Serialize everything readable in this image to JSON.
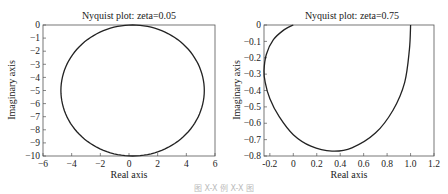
{
  "chart_data": [
    {
      "type": "line",
      "title": "Nyquist plot: zeta=0.05",
      "xlabel": "Real axis",
      "ylabel": "Imaginary axis",
      "xlim": [
        -6,
        6
      ],
      "ylim": [
        -10,
        0
      ],
      "xticks": [
        -6,
        -4,
        -2,
        0,
        2,
        4,
        6
      ],
      "xtick_labels": [
        "−6",
        "−4",
        "−2",
        "0",
        "2",
        "4",
        "6"
      ],
      "yticks": [
        0,
        -1,
        -2,
        -3,
        -4,
        -5,
        -6,
        -7,
        -8,
        -9,
        -10
      ],
      "ytick_labels": [
        "0",
        "−1",
        "−2",
        "−3",
        "−4",
        "−5",
        "−6",
        "−7",
        "−8",
        "−9",
        "−10"
      ],
      "grid": false,
      "series": [
        {
          "name": "G(jw)",
          "shape": "closed loop approx. circle",
          "center": [
            0.25,
            -5.0
          ],
          "x_range": [
            -4.75,
            5.25
          ],
          "y_range": [
            -10.0,
            0.0
          ]
        }
      ]
    },
    {
      "type": "line",
      "title": "Nyquist plot: zeta=0.75",
      "xlabel": "Real axis",
      "ylabel": "Imaginary axis",
      "xlim": [
        -0.25,
        1.2
      ],
      "ylim": [
        -0.8,
        0
      ],
      "xticks": [
        -0.2,
        0,
        0.2,
        0.4,
        0.6,
        0.8,
        1.0,
        1.2
      ],
      "xtick_labels": [
        "-0.2",
        "0",
        "0.2",
        "0.4",
        "0.6",
        "0.8",
        "1.0",
        "1.2"
      ],
      "yticks": [
        0,
        -0.1,
        -0.2,
        -0.3,
        -0.4,
        -0.5,
        -0.6,
        -0.7,
        -0.8
      ],
      "ytick_labels": [
        "0",
        "−0.1",
        "−0.2",
        "−0.3",
        "−0.4",
        "−0.5",
        "−0.6",
        "−0.7",
        "−0.8"
      ],
      "grid": false,
      "series": [
        {
          "name": "G(jw)",
          "x": [
            1.0,
            0.99,
            0.95,
            0.85,
            0.7,
            0.5,
            0.33,
            0.15,
            0.0,
            -0.12,
            -0.2,
            -0.24,
            -0.25,
            -0.23,
            -0.17,
            -0.08,
            0.0
          ],
          "y": [
            0.0,
            -0.15,
            -0.35,
            -0.52,
            -0.66,
            -0.75,
            -0.77,
            -0.74,
            -0.67,
            -0.56,
            -0.45,
            -0.35,
            -0.28,
            -0.18,
            -0.09,
            -0.03,
            0.0
          ]
        }
      ]
    }
  ],
  "caption": "图 X-X  例 X-X 图"
}
